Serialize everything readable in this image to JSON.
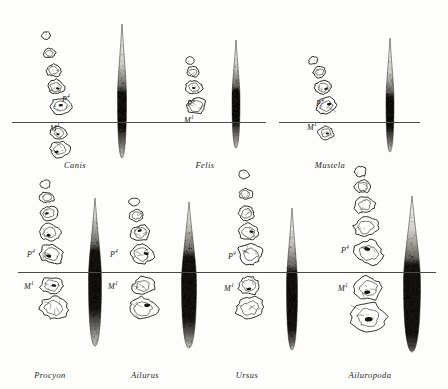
{
  "plate": {
    "kind": "comparative-dentition-plate",
    "description": "Upper cheek-tooth rows of seven carnivoran genera, each paired with a vertical spindle-shaped shading profile, aligned on the P4/M1 occlusal reference line.",
    "background_color": "#fdfdfb",
    "ink_color": "#14130f",
    "reference_line_color": "#4a4a46",
    "rows": [
      {
        "name": "upper-row",
        "reference_line_y": 122,
        "continuous_line": false,
        "panels": [
          {
            "id": "canis",
            "genus": "Canis",
            "label_x": 75,
            "label_y": 160,
            "tooth_x": 60,
            "spindle_x": 122,
            "p4_label": "P",
            "p4_sup": "4",
            "p4_x": 62,
            "p4_y": 99,
            "m1_label": "M",
            "m1_sup": "1",
            "m1_x": 50,
            "m1_y": 128,
            "teeth_above_line": 5,
            "teeth_below_line": 2,
            "spindle_top": 24,
            "spindle_bottom": 158,
            "spindle_max_width": 9,
            "spindle_dark_center": 110,
            "spindle_dark_height": 34
          },
          {
            "id": "felis",
            "genus": "Felis",
            "label_x": 205,
            "label_y": 160,
            "tooth_x": 197,
            "spindle_x": 236,
            "p4_label": "P",
            "p4_sup": "4",
            "p4_x": 187,
            "p4_y": 103,
            "m1_label": "M",
            "m1_sup": "1",
            "m1_x": 184,
            "m1_y": 120,
            "teeth_above_line": 4,
            "teeth_below_line": 0,
            "spindle_top": 40,
            "spindle_bottom": 148,
            "spindle_max_width": 8,
            "spindle_dark_center": 106,
            "spindle_dark_height": 30
          },
          {
            "id": "mustela",
            "genus": "Mustela",
            "label_x": 330,
            "label_y": 160,
            "tooth_x": 327,
            "spindle_x": 390,
            "p4_label": "P",
            "p4_sup": "4",
            "p4_x": 316,
            "p4_y": 103,
            "m1_label": "M",
            "m1_sup": "1",
            "m1_x": 307,
            "m1_y": 127,
            "teeth_above_line": 4,
            "teeth_below_line": 1,
            "spindle_top": 38,
            "spindle_bottom": 152,
            "spindle_max_width": 8,
            "spindle_dark_center": 112,
            "spindle_dark_height": 30
          }
        ]
      },
      {
        "name": "lower-row",
        "reference_line_y": 272,
        "continuous_line": true,
        "panels": [
          {
            "id": "procyon",
            "genus": "Procyon",
            "label_x": 50,
            "label_y": 370,
            "tooth_x": 52,
            "spindle_x": 95,
            "p4_label": "P",
            "p4_sup": "4",
            "p4_x": 27,
            "p4_y": 254,
            "m1_label": "M",
            "m1_sup": "1",
            "m1_x": 24,
            "m1_y": 286,
            "teeth_above_line": 5,
            "teeth_below_line": 2,
            "spindle_top": 198,
            "spindle_bottom": 346,
            "spindle_max_width": 13,
            "spindle_dark_center": 280,
            "spindle_dark_height": 58
          },
          {
            "id": "ailurus",
            "genus": "Ailurus",
            "label_x": 145,
            "label_y": 370,
            "tooth_x": 142,
            "spindle_x": 189,
            "p4_label": "P",
            "p4_sup": "4",
            "p4_x": 110,
            "p4_y": 254,
            "m1_label": "M",
            "m1_sup": "1",
            "m1_x": 108,
            "m1_y": 286,
            "teeth_above_line": 4,
            "teeth_below_line": 2,
            "spindle_top": 202,
            "spindle_bottom": 348,
            "spindle_max_width": 15,
            "spindle_dark_center": 288,
            "spindle_dark_height": 62
          },
          {
            "id": "ursus",
            "genus": "Ursus",
            "label_x": 247,
            "label_y": 370,
            "tooth_x": 250,
            "spindle_x": 292,
            "p4_label": "P",
            "p4_sup": "4",
            "p4_x": 228,
            "p4_y": 256,
            "m1_label": "M",
            "m1_sup": "1",
            "m1_x": 224,
            "m1_y": 288,
            "teeth_above_line": 5,
            "teeth_below_line": 2,
            "spindle_top": 208,
            "spindle_bottom": 350,
            "spindle_max_width": 11,
            "spindle_dark_center": 300,
            "spindle_dark_height": 56
          },
          {
            "id": "ailuropoda",
            "genus": "Ailuropoda",
            "label_x": 370,
            "label_y": 370,
            "tooth_x": 368,
            "spindle_x": 412,
            "p4_label": "P",
            "p4_sup": "4",
            "p4_x": 341,
            "p4_y": 250,
            "m1_label": "M",
            "m1_sup": "1",
            "m1_x": 338,
            "m1_y": 288,
            "teeth_above_line": 5,
            "teeth_below_line": 2,
            "spindle_top": 196,
            "spindle_bottom": 352,
            "spindle_max_width": 17,
            "spindle_dark_center": 300,
            "spindle_dark_height": 70
          }
        ]
      }
    ]
  }
}
